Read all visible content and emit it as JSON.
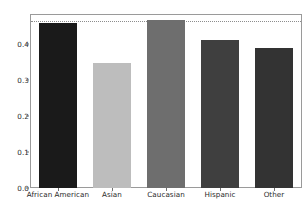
{
  "chart_data": {
    "type": "bar",
    "title": "",
    "xlabel": "",
    "ylabel": "",
    "categories": [
      "African American",
      "Asian",
      "Caucasian",
      "Hispanic",
      "Other"
    ],
    "values": [
      0.457,
      0.347,
      0.465,
      0.41,
      0.388
    ],
    "bar_colors": [
      "#1a1a1a",
      "#bdbdbd",
      "#6e6e6e",
      "#3f3f3f",
      "#333333"
    ],
    "ylim": [
      0.0,
      0.48
    ],
    "xlim": [
      0,
      5
    ],
    "yticks": [
      0.0,
      0.1,
      0.2,
      0.3,
      0.4
    ],
    "ytick_labels": [
      "0.0",
      "0.1",
      "0.2",
      "0.3",
      "0.4"
    ],
    "grid": false,
    "legend": null,
    "annotations": [
      {
        "type": "horizontal-reference-line",
        "value": 0.463,
        "style": "dotted",
        "color": "#8d8d8d"
      }
    ],
    "bar_width_ratio": 0.72,
    "frame_color": "#9a9a9a",
    "background_color": "#ffffff",
    "tick_color": "#6f6f6f",
    "label_color": "#2b2b2b"
  }
}
